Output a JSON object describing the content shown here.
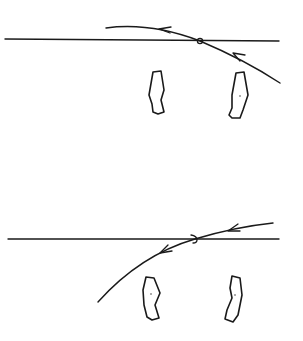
{
  "diagram": {
    "stroke_color": "#1a1a1a",
    "background_color": "#ffffff",
    "panels": [
      {
        "id": "top",
        "horizontal_line": {
          "x1": 5,
          "y1": 39,
          "x2": 279,
          "y2": 41
        },
        "ray_path": "M106,28 Q150,22 200,41 Q245,60 280,83",
        "crossing_point": {
          "x": 200,
          "y": 41
        },
        "arrowheads": [
          {
            "x": 160,
            "y": 29,
            "direction": "left"
          },
          {
            "x": 236,
            "y": 55,
            "direction": "up-left"
          }
        ],
        "blobs": [
          {
            "path": "M153,72 L161,71 L164,90 L161,100 L164,112 L158,114 L153,112 L152,104 L149,95 Z"
          },
          {
            "path": "M236,73 L244,72 L248,95 L243,110 L240,118 L232,118 L229,115 L232,108 L232,95 Z"
          }
        ]
      },
      {
        "id": "bottom",
        "horizontal_line": {
          "x1": 8,
          "y1": 239,
          "x2": 279,
          "y2": 239
        },
        "ray_path": "M273,223 Q235,227 195,239 Q140,255 98,302",
        "crossing_point": {
          "x": 195,
          "y": 239
        },
        "arrowheads": [
          {
            "x": 233,
            "y": 230,
            "direction": "left"
          },
          {
            "x": 165,
            "y": 251,
            "direction": "down-left"
          }
        ],
        "blobs": [
          {
            "path": "M146,277 L154,278 L160,293 L155,305 L159,318 L152,320 L147,317 L144,305 L143,290 Z"
          },
          {
            "path": "M232,276 L240,278 L242,295 L238,315 L233,322 L225,319 L227,310 L232,298 L230,288 Z"
          }
        ]
      }
    ]
  }
}
